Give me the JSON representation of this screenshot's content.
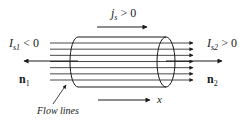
{
  "diagram": {
    "labels": {
      "js": {
        "main": "j",
        "sub": "s",
        "rel": " > 0"
      },
      "is1": {
        "main": "I",
        "sub": "s1",
        "rel": " < 0"
      },
      "is2": {
        "main": "I",
        "sub": "s2",
        "rel": " > 0"
      },
      "n1": {
        "main": "n",
        "sub": "1"
      },
      "n2": {
        "main": "n",
        "sub": "2"
      },
      "x": "x",
      "flow_lines": "Flow lines"
    },
    "flow_line_count": 7,
    "colors": {
      "ink": "#1a1a1a",
      "background": "#ffffff"
    }
  }
}
